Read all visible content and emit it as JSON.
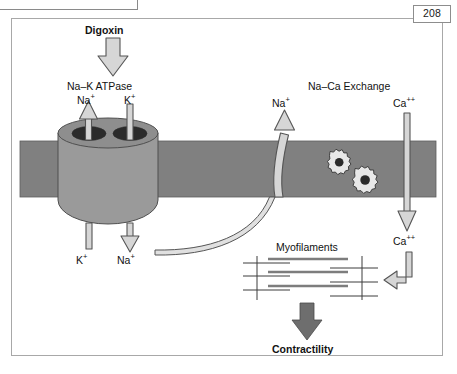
{
  "figure": {
    "page_number": "208",
    "title_implicit": "Digoxin mechanism of action",
    "labels": {
      "digoxin": "Digoxin",
      "na_k_atpase": "Na–K ATPase",
      "na_top": "Na",
      "na_top_charge": "+",
      "k_top": "K",
      "k_top_charge": "+",
      "k_bottom": "K",
      "k_bottom_charge": "+",
      "na_bottom": "Na",
      "na_bottom_charge": "+",
      "na_efflux": "Na",
      "na_efflux_charge": "+",
      "na_ca_exchange": "Na–Ca Exchange",
      "ca_outside": "Ca",
      "ca_outside_charge": "++",
      "ca_inside": "Ca",
      "ca_inside_charge": "++",
      "myofilaments": "Myofilaments",
      "contractility": "Contractility"
    },
    "colors": {
      "membrane_fill": "#808080",
      "pump_fill": "#9a9a9a",
      "pump_top_fill": "#8e8e8e",
      "pore_fill": "#2b2b2b",
      "arrow_light_fill": "#d6d6d6",
      "arrow_light_stroke": "#555555",
      "arrow_dark_fill": "#6e6e6e",
      "gear_fill": "#e8e8e8",
      "gear_stroke": "#4a4a4a",
      "filament_thick": "#7d7d7d",
      "filament_thin": "#3c3c3c",
      "frame_border": "#a8a8a8",
      "text": "#121212",
      "page_box_border": "#8d8d8d"
    },
    "membrane": {
      "x": 20,
      "y": 141,
      "width": 416,
      "height": 56
    },
    "pump": {
      "cx": 108,
      "top_y": 133,
      "rx": 50,
      "ry": 15,
      "body_bottom": 222
    },
    "gears": [
      {
        "cx": 330,
        "cy": 167,
        "r": 16,
        "teeth": 10
      },
      {
        "cx": 355,
        "cy": 185,
        "r": 18,
        "teeth": 10
      }
    ]
  }
}
